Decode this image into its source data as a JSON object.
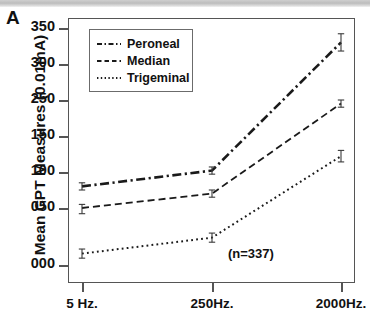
{
  "panel": {
    "label": "A"
  },
  "axes": {
    "y_title": "Mean CPT Measures (0.01mA)",
    "y_ticks": [
      {
        "label": "350",
        "value": 350
      },
      {
        "label": "300",
        "value": 300
      },
      {
        "label": "250",
        "value": 250
      },
      {
        "label": "150",
        "value": 150
      },
      {
        "label": "100",
        "value": 100
      },
      {
        "label": "050",
        "value": 50
      },
      {
        "label": "000",
        "value": 0
      }
    ],
    "x_ticks": [
      {
        "label": "5 Hz."
      },
      {
        "label": "250Hz."
      },
      {
        "label": "2000Hz."
      }
    ]
  },
  "legend": {
    "items": [
      {
        "label": "Peroneal",
        "style": "dash-dot"
      },
      {
        "label": "Median",
        "style": "dashed"
      },
      {
        "label": "Trigeminal",
        "style": "dotted"
      }
    ]
  },
  "annotation": {
    "sample_size": "(n=337)"
  },
  "colors": {
    "line": "#1a1a1a",
    "frame": "#555555",
    "text": "#111111",
    "background": "#ffffff"
  },
  "chart_data": {
    "type": "line",
    "xlabel": "",
    "ylabel": "Mean CPT Measures (0.01mA)",
    "categories": [
      "5 Hz.",
      "250Hz.",
      "2000Hz."
    ],
    "ylim": [
      0,
      350
    ],
    "ytick_labels": [
      "000",
      "050",
      "100",
      "150",
      "250",
      "300",
      "350"
    ],
    "grid": false,
    "legend_position": "top-left inside plot",
    "annotations": [
      "(n=337)"
    ],
    "error_bars": true,
    "series": [
      {
        "name": "Peroneal",
        "style": "dash-dot",
        "values": [
          80,
          102,
          330
        ],
        "errors": [
          5,
          5,
          12
        ]
      },
      {
        "name": "Median",
        "style": "dashed",
        "values": [
          50,
          70,
          240
        ],
        "errors": [
          5,
          5,
          10
        ]
      },
      {
        "name": "Trigeminal",
        "style": "dotted",
        "values": [
          10,
          24,
          122
        ],
        "errors": [
          4,
          4,
          8
        ]
      }
    ]
  }
}
